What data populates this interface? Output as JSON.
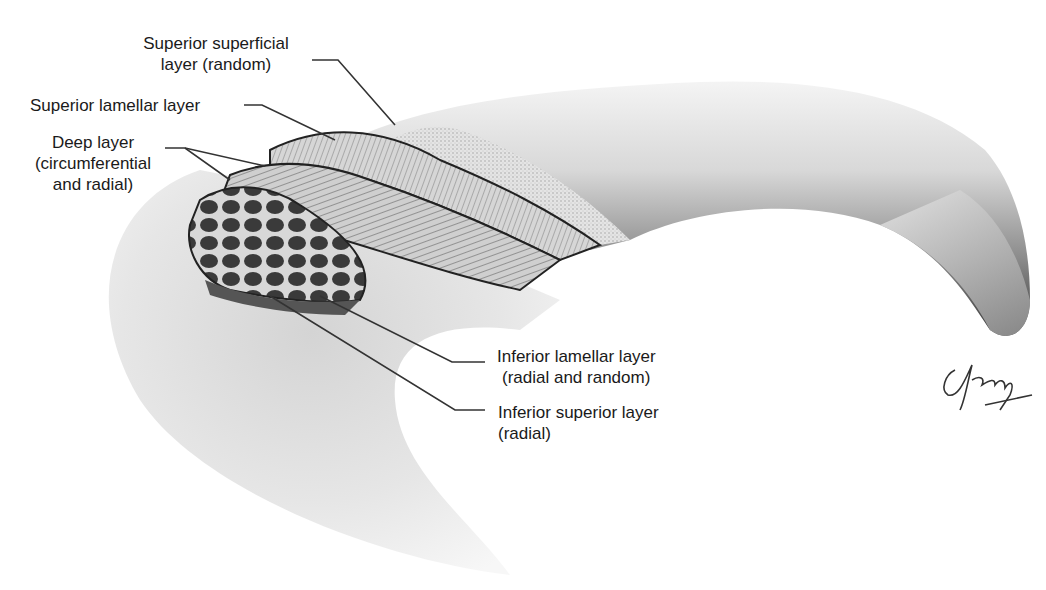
{
  "figure": {
    "labels": {
      "superior_superficial": {
        "line1": "Superior superficial",
        "line2": "layer (random)"
      },
      "superior_lamellar": {
        "line1": "Superior lamellar layer"
      },
      "deep": {
        "line1": "Deep layer",
        "line2": "(circumferential",
        "line3": "and radial)"
      },
      "inferior_lamellar": {
        "line1": "Inferior lamellar layer",
        "line2": "(radial and random)"
      },
      "inferior_superior": {
        "line1": "Inferior superior layer",
        "line2": "(radial)"
      }
    },
    "signature": "artist-signature"
  }
}
